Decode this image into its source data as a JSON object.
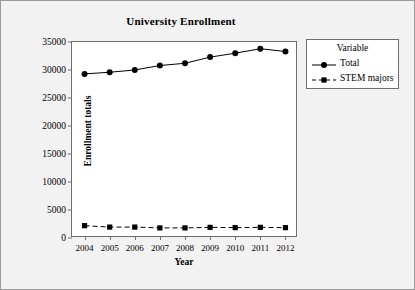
{
  "figure": {
    "title": "University Enrollment",
    "background": "#f2f2f2",
    "plot_background": "#ffffff",
    "frame_color": "#6e6e6e"
  },
  "legend": {
    "title": "Variable",
    "entries": [
      {
        "label": "Total",
        "marker": "filled-circle",
        "line": "solid",
        "color": "#000000"
      },
      {
        "label": "STEM majors",
        "marker": "filled-square",
        "line": "dashed",
        "color": "#000000"
      }
    ]
  },
  "axes": {
    "x": {
      "label": "Year",
      "ticks": [
        "2004",
        "2005",
        "2006",
        "2007",
        "2008",
        "2009",
        "2010",
        "2011",
        "2012"
      ]
    },
    "y": {
      "label": "Enrollment totals",
      "ticks": [
        "0",
        "5000",
        "10000",
        "15000",
        "20000",
        "25000",
        "30000",
        "35000"
      ]
    }
  },
  "chart_data": {
    "type": "line",
    "title": "University Enrollment",
    "xlabel": "Year",
    "ylabel": "Enrollment totals",
    "categories": [
      2004,
      2005,
      2006,
      2007,
      2008,
      2009,
      2010,
      2011,
      2012
    ],
    "ylim": [
      0,
      35000
    ],
    "ytick_step": 5000,
    "grid": false,
    "legend_position": "right",
    "legend_title": "Variable",
    "series": [
      {
        "name": "Total",
        "marker": "filled-circle",
        "line": "solid",
        "color": "#000000",
        "values": [
          29300,
          29600,
          30000,
          30800,
          31200,
          32300,
          33000,
          33800,
          33300
        ]
      },
      {
        "name": "STEM majors",
        "marker": "filled-square",
        "line": "dashed",
        "color": "#000000",
        "values": [
          2200,
          1950,
          1950,
          1800,
          1800,
          1900,
          1850,
          1900,
          1850
        ]
      }
    ]
  }
}
